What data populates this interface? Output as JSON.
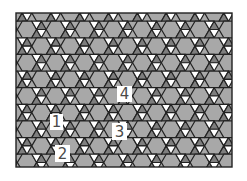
{
  "figure": {
    "type": "trihexagonal-tiling",
    "frame": {
      "x": 16,
      "y": 13,
      "width": 216,
      "height": 154
    },
    "edge": 9.6,
    "offset_x": 27,
    "offset_y": 29.5,
    "colors": {
      "background": "#ffffff",
      "hexagon": "#a8a8a8",
      "triangle_up": "#7e7e7e",
      "triangle_down": "#ffffff",
      "line": "#222222",
      "label_text": "#4a4a4a",
      "label_bg": "#ffffff"
    }
  },
  "labels": [
    {
      "text": "1",
      "x": 50,
      "y": 114,
      "w": 13,
      "h": 16
    },
    {
      "text": "2",
      "x": 55,
      "y": 145,
      "w": 15,
      "h": 17
    },
    {
      "text": "3",
      "x": 112,
      "y": 123,
      "w": 15,
      "h": 17
    },
    {
      "text": "4",
      "x": 117,
      "y": 86,
      "w": 15,
      "h": 16
    }
  ]
}
